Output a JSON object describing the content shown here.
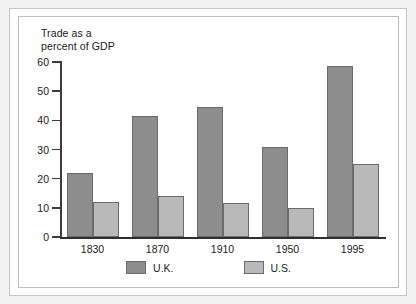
{
  "chart_data": {
    "type": "bar",
    "title": "",
    "subtitle": "",
    "axis_caption": "Trade as a\npercent of GDP",
    "xlabel": "",
    "ylabel": "Trade as a percent of GDP",
    "categories": [
      "1830",
      "1870",
      "1910",
      "1950",
      "1995"
    ],
    "series": [
      {
        "name": "U.K.",
        "color": "#8d8d8d",
        "values": [
          22,
          41.5,
          44.5,
          31,
          58.5
        ]
      },
      {
        "name": "U.S.",
        "color": "#b9b9b9",
        "values": [
          12,
          14,
          11.5,
          10,
          25
        ]
      }
    ],
    "ylim": [
      0,
      60
    ],
    "ytick_labels": [
      "0",
      "10",
      "20",
      "30",
      "40",
      "50",
      "60"
    ],
    "ytick_values": [
      0,
      10,
      20,
      30,
      40,
      50,
      60
    ],
    "grid": false,
    "legend_position": "bottom"
  },
  "legend": {
    "entries": [
      {
        "label": "U.K."
      },
      {
        "label": "U.S."
      }
    ]
  }
}
